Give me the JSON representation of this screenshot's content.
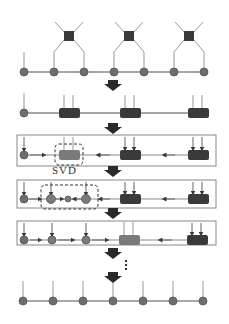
{
  "diagram": {
    "colors": {
      "node": "#6e6e6e",
      "node_stroke": "#555555",
      "tensor_dark": "#3a3a3a",
      "tensor_gray": "#7a7a7a",
      "line": "#8a8a8a",
      "arrow": "#3a3a3a",
      "box": "#888888"
    },
    "svd_label": "SVD",
    "ellipsis": "⋮",
    "stages": [
      {
        "name": "initial-mps-with-gates",
        "nodes": 7,
        "gates": 3
      },
      {
        "name": "contracted-blocks",
        "nodes": 1,
        "blocks": 3
      },
      {
        "name": "canonical-form-svd-target"
      },
      {
        "name": "after-svd-split"
      },
      {
        "name": "next-block-target"
      },
      {
        "name": "final-mps",
        "nodes": 7
      }
    ]
  }
}
